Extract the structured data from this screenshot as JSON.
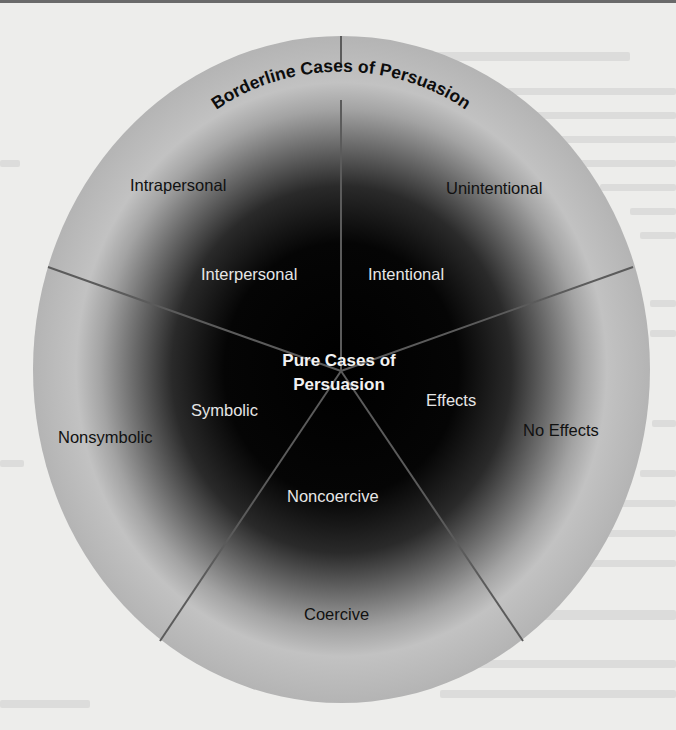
{
  "diagram": {
    "title": "Borderline Cases of Persuasion",
    "center_label_line1": "Pure Cases of",
    "center_label_line2": "Persuasion",
    "colors": {
      "center": "#000000",
      "rim": "#b9b9b9",
      "divider": "#5a5a5a",
      "page_background": "#ededeb"
    },
    "dimensions": [
      {
        "name": "interpersonal-intrapersonal",
        "pure_label": "Interpersonal",
        "borderline_label": "Intrapersonal"
      },
      {
        "name": "intentional-unintentional",
        "pure_label": "Intentional",
        "borderline_label": "Unintentional"
      },
      {
        "name": "effects-no-effects",
        "pure_label": "Effects",
        "borderline_label": "No Effects"
      },
      {
        "name": "noncoercive-coercive",
        "pure_label": "Noncoercive",
        "borderline_label": "Coercive"
      },
      {
        "name": "symbolic-nonsymbolic",
        "pure_label": "Symbolic",
        "borderline_label": "Nonsymbolic"
      }
    ]
  }
}
